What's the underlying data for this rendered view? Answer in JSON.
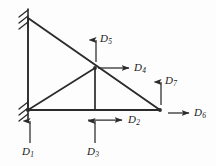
{
  "figure": {
    "kind": "structural-truss-degrees-of-freedom-diagram",
    "background_color": "#fdfdfd",
    "line_color": "#2b2b2b",
    "label_color": "#1a1a1a"
  },
  "nodes": [
    {
      "id": "top-left",
      "name": "node-top-left",
      "x": 28,
      "y": 18,
      "support": "fixed"
    },
    {
      "id": "bottom-left",
      "name": "node-bottom-left",
      "x": 28,
      "y": 110,
      "support": "fixed"
    },
    {
      "id": "middle-top",
      "name": "node-middle-top",
      "x": 95,
      "y": 68,
      "support": "none"
    },
    {
      "id": "bottom-middle",
      "name": "node-bottom-middle",
      "x": 95,
      "y": 110,
      "support": "none"
    },
    {
      "id": "bottom-right",
      "name": "node-bottom-right",
      "x": 160,
      "y": 110,
      "support": "none"
    }
  ],
  "members": [
    {
      "name": "member-left-vertical",
      "from": "top-left",
      "to": "bottom-left"
    },
    {
      "name": "member-top-chord",
      "from": "top-left",
      "to": "bottom-right"
    },
    {
      "name": "member-bottom-chord",
      "from": "bottom-left",
      "to": "bottom-right"
    },
    {
      "name": "member-diagonal-web",
      "from": "bottom-left",
      "to": "middle-top"
    },
    {
      "name": "member-vertical-web",
      "from": "middle-top",
      "to": "bottom-middle"
    }
  ],
  "supports": [
    {
      "name": "support-top-left",
      "x": 28,
      "y": 18,
      "type": "fixed-hatched"
    },
    {
      "name": "support-bottom-left",
      "x": 28,
      "y": 110,
      "type": "fixed-hatched"
    }
  ],
  "degrees_of_freedom": [
    {
      "id": "D1",
      "label": "D",
      "subscript": "1",
      "name": "dof-d1",
      "direction": "up",
      "at_node": "bottom-left",
      "arrow": {
        "x1": 30,
        "y1": 143,
        "x2": 30,
        "y2": 119
      },
      "label_pos": {
        "left": 22,
        "top": 146
      }
    },
    {
      "id": "D2",
      "label": "D",
      "subscript": "2",
      "name": "dof-d2",
      "direction": "right",
      "at_node": "bottom-middle",
      "arrow": {
        "x1": 88,
        "y1": 120,
        "x2": 124,
        "y2": 120
      },
      "label_pos": {
        "left": 128,
        "top": 115
      }
    },
    {
      "id": "D3",
      "label": "D",
      "subscript": "3",
      "name": "dof-d3",
      "direction": "up",
      "at_node": "bottom-middle",
      "arrow": {
        "x1": 95,
        "y1": 143,
        "x2": 95,
        "y2": 119
      },
      "label_pos": {
        "left": 87,
        "top": 146
      }
    },
    {
      "id": "D4",
      "label": "D",
      "subscript": "4",
      "name": "dof-d4",
      "direction": "right",
      "at_node": "middle-top",
      "arrow": {
        "x1": 98,
        "y1": 68,
        "x2": 131,
        "y2": 68
      },
      "label_pos": {
        "left": 135,
        "top": 63
      }
    },
    {
      "id": "D5",
      "label": "D",
      "subscript": "5",
      "name": "dof-d5",
      "direction": "up",
      "at_node": "middle-top",
      "arrow": {
        "x1": 96,
        "y1": 62,
        "x2": 96,
        "y2": 38
      },
      "label_pos": {
        "left": 100,
        "top": 33
      }
    },
    {
      "id": "D6",
      "label": "D",
      "subscript": "6",
      "name": "dof-d6",
      "direction": "right",
      "at_node": "bottom-right",
      "arrow": {
        "x1": 166,
        "y1": 113,
        "x2": 191,
        "y2": 113
      },
      "label_pos": {
        "left": 195,
        "top": 108
      }
    },
    {
      "id": "D7",
      "label": "D",
      "subscript": "7",
      "name": "dof-d7",
      "direction": "up",
      "at_node": "bottom-right",
      "arrow": {
        "x1": 161,
        "y1": 105,
        "x2": 161,
        "y2": 80
      },
      "label_pos": {
        "left": 165,
        "top": 75
      }
    }
  ]
}
